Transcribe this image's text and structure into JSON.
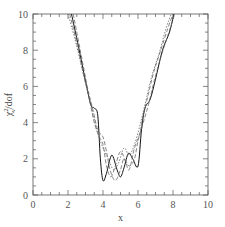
{
  "chart_data": {
    "type": "line",
    "title": "",
    "xlabel": "x",
    "ylabel": "χ²_ν / dof",
    "ylabel_display": "χν² / dof",
    "xlim": [
      0,
      10
    ],
    "ylim": [
      0,
      10
    ],
    "grid": false,
    "legend": null,
    "x_ticks": [
      "0",
      "2",
      "4",
      "6",
      "8",
      "10"
    ],
    "y_ticks": [
      "0",
      "2",
      "4",
      "6",
      "8",
      "10"
    ],
    "series": [
      {
        "name": "solid",
        "style": "solid",
        "x": [
          2.2,
          2.6,
          3.0,
          3.3,
          3.5,
          3.7,
          3.85,
          4.0,
          4.2,
          4.5,
          4.8,
          5.0,
          5.2,
          5.45,
          5.7,
          6.0,
          6.2,
          6.4,
          6.7,
          7.0,
          7.4,
          7.8,
          8.05
        ],
        "y": [
          10.0,
          8.2,
          6.3,
          5.0,
          4.8,
          4.4,
          2.0,
          0.8,
          1.2,
          2.2,
          1.4,
          1.0,
          1.5,
          2.3,
          2.0,
          1.6,
          3.6,
          4.8,
          5.3,
          6.4,
          8.0,
          9.0,
          10.0
        ]
      },
      {
        "name": "dashed-1",
        "style": "dashed",
        "x": [
          2.1,
          2.5,
          2.9,
          3.2,
          3.5,
          3.8,
          4.0,
          4.2,
          4.45,
          4.7,
          5.0,
          5.3,
          5.5,
          5.8,
          6.1,
          6.3,
          6.6,
          6.9,
          7.3,
          7.7,
          8.0
        ],
        "y": [
          10.0,
          8.4,
          6.6,
          5.4,
          4.0,
          3.2,
          2.8,
          1.6,
          1.0,
          1.6,
          2.4,
          1.8,
          1.4,
          2.6,
          3.4,
          4.4,
          5.6,
          6.8,
          8.0,
          9.2,
          10.0
        ]
      },
      {
        "name": "dashed-2",
        "style": "dashed",
        "x": [
          2.3,
          2.7,
          3.1,
          3.4,
          3.7,
          4.0,
          4.2,
          4.4,
          4.7,
          5.0,
          5.2,
          5.5,
          5.8,
          6.0,
          6.3,
          6.6,
          6.9,
          7.3,
          7.7,
          8.1
        ],
        "y": [
          10.0,
          8.0,
          6.0,
          4.8,
          3.6,
          3.2,
          2.4,
          1.4,
          0.8,
          1.4,
          2.0,
          1.6,
          2.0,
          3.0,
          4.0,
          5.0,
          6.2,
          7.6,
          8.8,
          10.0
        ]
      },
      {
        "name": "dotted",
        "style": "dotted",
        "x": [
          2.0,
          2.4,
          2.8,
          3.1,
          3.4,
          3.7,
          4.0,
          4.3,
          4.6,
          4.9,
          5.2,
          5.5,
          5.8,
          6.1,
          6.4,
          6.8,
          7.2,
          7.6,
          7.9
        ],
        "y": [
          10.0,
          8.6,
          7.0,
          5.8,
          4.6,
          3.4,
          2.6,
          2.0,
          1.4,
          1.8,
          2.6,
          2.2,
          2.8,
          3.8,
          5.0,
          6.6,
          7.8,
          9.2,
          10.0
        ]
      }
    ]
  },
  "plot": {
    "frame": {
      "left": 33,
      "right": 208,
      "top": 14,
      "bottom": 195
    },
    "line_color": "#111111",
    "dash_color": "#666666",
    "axis_color": "#555555"
  }
}
